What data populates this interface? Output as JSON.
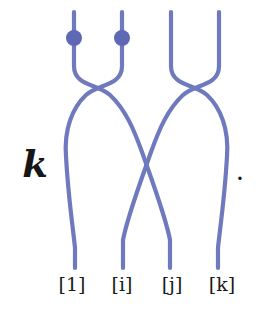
{
  "figure": {
    "kind": "braid-diagram",
    "width": 265,
    "height": 322,
    "background_color": "#ffffff",
    "coefficient": "k",
    "trailing_punctuation": ".",
    "strand_color": "#6f79bd",
    "strand_width": 4.2,
    "dot_color": "#5e68b4",
    "dot_radius": 8,
    "label_color": "#1b1b1b"
  },
  "strands": {
    "top_x": [
      74,
      122,
      171,
      219
    ],
    "bottom_x": [
      75,
      122,
      170,
      218
    ],
    "top_y": 12,
    "bottom_y": 268,
    "dots": [
      {
        "name": "dot-strand-1",
        "cx": 74,
        "cy": 38,
        "r": 8
      },
      {
        "name": "dot-strand-2",
        "cx": 122,
        "cy": 38,
        "r": 8
      }
    ],
    "paths": [
      {
        "name": "strand-a",
        "d": "M 74 12 L 74 66 C 74 86 98 84 110 95 C 126 110 134 130 142 152 C 154 186 166 218 170 240 L 170 268"
      },
      {
        "name": "strand-b",
        "d": "M 122 12 L 122 66 C 122 86 98 84 86 95 C 72 108 64 130 66 156 C 68 196 74 236 75 248 L 75 268"
      },
      {
        "name": "strand-c",
        "d": "M 171 12 L 171 66 C 171 86 195 84 207 95 C 221 108 229 130 227 156 C 225 196 219 236 218 248 L 218 268"
      },
      {
        "name": "strand-d",
        "d": "M 219 12 L 219 66 C 219 86 195 84 183 95 C 167 110 159 130 151 152 C 139 186 127 218 123 240 L 123 268"
      }
    ]
  },
  "labels": {
    "items": [
      {
        "name": "strand-label-1",
        "text": "[1]"
      },
      {
        "name": "strand-label-i",
        "text": "[i]"
      },
      {
        "name": "strand-label-j",
        "text": "[j]"
      },
      {
        "name": "strand-label-k",
        "text": "[k]"
      }
    ]
  }
}
